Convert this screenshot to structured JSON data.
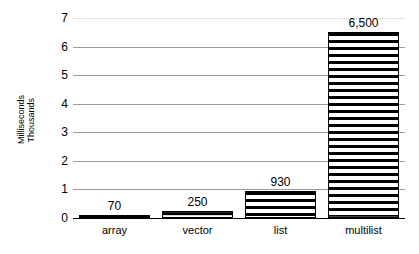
{
  "chart_data": {
    "type": "bar",
    "title": "",
    "xlabel": "",
    "ylabel_lines": [
      "Milliseconds",
      "Thousands"
    ],
    "ylabel": "Milliseconds Thousands",
    "categories": [
      "array",
      "vector",
      "list",
      "multilist"
    ],
    "values": [
      0.07,
      0.25,
      0.93,
      6.5
    ],
    "value_labels": [
      "70",
      "250",
      "930",
      "6,500"
    ],
    "raw_values_ms": [
      70,
      250,
      930,
      6500
    ],
    "units": "Milliseconds (Thousands)",
    "ylim": [
      0,
      7
    ],
    "ytick_labels": [
      "0",
      "1",
      "2",
      "3",
      "4",
      "5",
      "6",
      "7"
    ],
    "ytick_values": [
      0,
      1,
      2,
      3,
      4,
      5,
      6,
      7
    ],
    "grid": true,
    "grid_orientation": "horizontal",
    "legend": "none",
    "bar_fill": "horizontal-stripes",
    "bar_edge_color": "#000000",
    "grid_color": "#9a9a9a",
    "background": "#ffffff",
    "text_color": "#000000"
  }
}
